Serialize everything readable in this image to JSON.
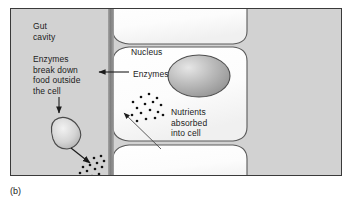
{
  "figure": {
    "caption": "(b)",
    "background_color": "#d2d2d2",
    "cell_color": "#fcfcfc",
    "outline_color": "#4a4a4a",
    "text_color": "#1c1c1c"
  },
  "labels": {
    "gut_cavity": "Gut\ncavity",
    "enzymes_break_down": "Enzymes\nbreak down\nfood outside\nthe cell",
    "nucleus": "Nucleus",
    "enzymes": "Enzymes",
    "nutrients_absorbed": "Nutrients\nabsorbed\ninto cell",
    "nutrients": "Nutrients"
  },
  "structures": {
    "top_cell": "epithelial-cell-top",
    "middle_cell": "epithelial-cell-middle",
    "bottom_cell": "epithelial-cell-bottom",
    "nucleus_organelle": "nucleus-ellipse",
    "food_particle": "food-particle-blob",
    "brush_border": "brush-border-band"
  },
  "arrows": {
    "enzymes_pointer": "leader-line-left-arrow",
    "breakdown_down": "down-arrow-to-food",
    "food_to_nutrients": "diagonal-arrow-to-nutrients",
    "nutrients_into_cell": "diagonal-arrow-into-cell"
  },
  "particles": {
    "nutrients_outside_count": 14,
    "nutrients_inside_count": 16
  }
}
